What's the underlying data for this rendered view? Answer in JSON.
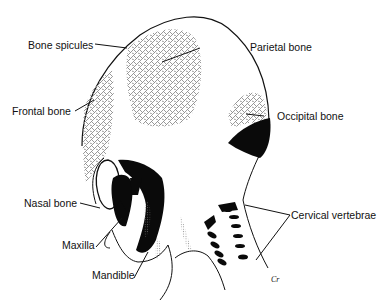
{
  "figure": {
    "colors": {
      "outline": "#111111",
      "bone_spicules": "#8f8f8f",
      "solid_bone": "#0a0a0a",
      "background": "#ffffff"
    }
  },
  "labels": [
    {
      "id": "bone-spicules",
      "text": "Bone spicules"
    },
    {
      "id": "parietal-bone",
      "text": "Parietal bone"
    },
    {
      "id": "frontal-bone",
      "text": "Frontal bone"
    },
    {
      "id": "occipital-bone",
      "text": "Occipital bone"
    },
    {
      "id": "nasal-bone",
      "text": "Nasal bone"
    },
    {
      "id": "maxilla",
      "text": "Maxilla"
    },
    {
      "id": "mandible",
      "text": "Mandible"
    },
    {
      "id": "cervical-vertebrae",
      "text": "Cervical vertebrae"
    }
  ],
  "signature": "Cr"
}
